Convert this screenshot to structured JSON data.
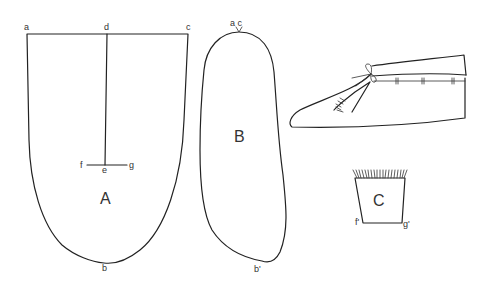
{
  "figure": {
    "colors": {
      "line": "#222222",
      "text": "#333333",
      "background": "#ffffff"
    }
  },
  "pieces": {
    "A": {
      "label": "A",
      "points": {
        "a": "a",
        "d": "d",
        "c": "c",
        "e": "e",
        "f": "f",
        "g": "g",
        "b": "b"
      }
    },
    "B": {
      "label": "B",
      "points": {
        "ac": "a c",
        "b1": "b'"
      }
    },
    "C": {
      "label": "C",
      "points": {
        "f1": "f'",
        "g1": "g'"
      }
    },
    "moccasin": {
      "label": "finished moccasin (side view)"
    }
  }
}
